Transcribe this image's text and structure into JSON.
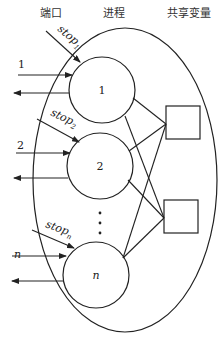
{
  "headers": {
    "ports": "端口",
    "processes": "进程",
    "shared_vars": "共享变量"
  },
  "processes": [
    {
      "label": "1",
      "port_label": "1",
      "stop_label": "stop",
      "stop_sub": "1"
    },
    {
      "label": "2",
      "port_label": "2",
      "stop_label": "stop",
      "stop_sub": "2"
    },
    {
      "label": "n",
      "port_label": "n",
      "stop_label": "stop",
      "stop_sub": "n"
    }
  ],
  "ellipsis": "⋮",
  "shared_variables": [
    {
      "label": ""
    },
    {
      "label": ""
    }
  ],
  "colors": {
    "line": "#222222",
    "background": "#ffffff"
  }
}
